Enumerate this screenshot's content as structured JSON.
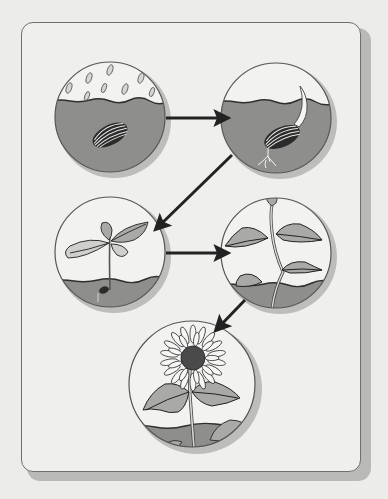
{
  "diagram": {
    "title": "Sunflower life cycle",
    "colors": {
      "background": "#ececea",
      "frame_border": "#6f6f6d",
      "frame_shadow": "#b9b9b7",
      "sky": "#f2f2f0",
      "soil": "#8e8e8c",
      "leaf": "#a9a9a7",
      "outline": "#2f2f2f",
      "arrow": "#222222",
      "circle_shadow": "#bdbdbb",
      "flower_petal": "#f6f6f4",
      "flower_center": "#4a4a4a"
    },
    "stages": [
      {
        "id": "seed",
        "label": "Seed planted in soil with rain falling",
        "cx": 110,
        "cy": 117,
        "r": 56
      },
      {
        "id": "germination",
        "label": "Seed germinates: shoot and root emerge",
        "cx": 276,
        "cy": 118,
        "r": 56
      },
      {
        "id": "seedling",
        "label": "Seedling with first leaves",
        "cx": 110,
        "cy": 252,
        "r": 56
      },
      {
        "id": "young-plant",
        "label": "Young plant with bud",
        "cx": 276,
        "cy": 253,
        "r": 56
      },
      {
        "id": "flowering",
        "label": "Mature sunflower in bloom",
        "cx": 192,
        "cy": 384,
        "r": 64
      }
    ],
    "arrows": [
      {
        "from": "seed",
        "to": "germination",
        "x1": 166,
        "y1": 118,
        "x2": 228,
        "y2": 118
      },
      {
        "from": "germination",
        "to": "seedling",
        "x1": 232,
        "y1": 155,
        "x2": 155,
        "y2": 230
      },
      {
        "from": "seedling",
        "to": "young-plant",
        "x1": 166,
        "y1": 253,
        "x2": 228,
        "y2": 253
      },
      {
        "from": "young-plant",
        "to": "flowering",
        "x1": 245,
        "y1": 300,
        "x2": 215,
        "y2": 331
      }
    ]
  }
}
